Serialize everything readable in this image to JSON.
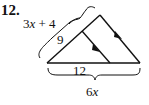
{
  "problem": {
    "number": "12.",
    "labels": {
      "left_total": {
        "coef": "3",
        "var": "x",
        "rest": " + 4"
      },
      "left_part": "9",
      "base_part": "12",
      "base_total": {
        "coef": "6",
        "var": "x"
      }
    },
    "colors": {
      "ink": "#111111",
      "background": "#ffffff"
    },
    "figure": {
      "description": "Triangle with a segment parallel to one side, marked by matching arrowheads",
      "parallel_marks": "single-arrow"
    }
  }
}
